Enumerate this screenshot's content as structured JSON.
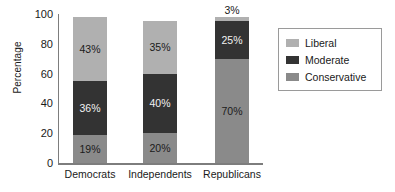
{
  "chart_data": {
    "type": "bar",
    "subtype": "stacked-bar",
    "title": "",
    "xlabel": "",
    "ylabel": "Percentage",
    "ylim": [
      0,
      100
    ],
    "yticks": [
      0,
      20,
      40,
      60,
      80,
      100
    ],
    "ytick_labels": [
      "0",
      "20",
      "40",
      "60",
      "80",
      "100"
    ],
    "grid": false,
    "legend_position": "right",
    "categories": [
      "Democrats",
      "Independents",
      "Republicans"
    ],
    "stack_order_bottom_to_top": [
      "Conservative",
      "Moderate",
      "Liberal"
    ],
    "series": [
      {
        "name": "Conservative",
        "color": "#8a8a8a",
        "values": [
          19,
          20,
          70
        ],
        "labels": [
          "19%",
          "20%",
          "70%"
        ]
      },
      {
        "name": "Moderate",
        "color": "#333333",
        "values": [
          36,
          40,
          25
        ],
        "labels": [
          "36%",
          "40%",
          "25%"
        ]
      },
      {
        "name": "Liberal",
        "color": "#b0b0b0",
        "values": [
          43,
          35,
          3
        ],
        "labels": [
          "43%",
          "35%",
          "3%"
        ]
      }
    ],
    "totals": [
      98,
      95,
      98
    ]
  },
  "axes": {
    "y_title": "Percentage",
    "y_ticks": [
      {
        "value": 100,
        "label": "100"
      },
      {
        "value": 80,
        "label": "80"
      },
      {
        "value": 60,
        "label": "60"
      },
      {
        "value": 40,
        "label": "40"
      },
      {
        "value": 20,
        "label": "20"
      },
      {
        "value": 0,
        "label": "0"
      }
    ],
    "x_ticks": [
      {
        "label": "Democrats"
      },
      {
        "label": "Independents"
      },
      {
        "label": "Republicans"
      }
    ]
  },
  "bars": [
    {
      "category": "Democrats",
      "segments": [
        {
          "series": "Liberal",
          "value": 43,
          "label": "43%"
        },
        {
          "series": "Moderate",
          "value": 36,
          "label": "36%"
        },
        {
          "series": "Conservative",
          "value": 19,
          "label": "19%"
        }
      ]
    },
    {
      "category": "Independents",
      "segments": [
        {
          "series": "Liberal",
          "value": 35,
          "label": "35%"
        },
        {
          "series": "Moderate",
          "value": 40,
          "label": "40%"
        },
        {
          "series": "Conservative",
          "value": 20,
          "label": "20%"
        }
      ]
    },
    {
      "category": "Republicans",
      "segments": [
        {
          "series": "Liberal",
          "value": 3,
          "label": "3%"
        },
        {
          "series": "Moderate",
          "value": 25,
          "label": "25%"
        },
        {
          "series": "Conservative",
          "value": 70,
          "label": "70%"
        }
      ]
    }
  ],
  "legend": {
    "items": [
      {
        "label": "Liberal",
        "color": "#b0b0b0"
      },
      {
        "label": "Moderate",
        "color": "#333333"
      },
      {
        "label": "Conservative",
        "color": "#8a8a8a"
      }
    ]
  },
  "colors": {
    "liberal": "#b0b0b0",
    "moderate": "#333333",
    "conservative": "#8a8a8a",
    "axis": "#7d7d7d",
    "text": "#1a1a1a",
    "background": "#ffffff"
  }
}
